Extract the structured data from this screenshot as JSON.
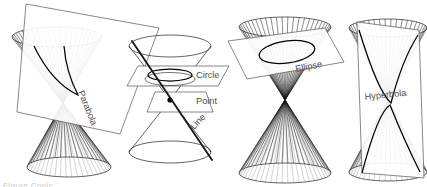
{
  "figure": {
    "background_color": "#ffffff",
    "line_color": "#4a4a4a",
    "curve_color": "#000000",
    "label_color": "#4d4d4d",
    "width": 427,
    "height": 187,
    "caption_text": "Figure  Conic"
  },
  "panels": [
    {
      "id": "parabola",
      "label": "Parabola",
      "description": "double cone cut by a plane parallel to a generator",
      "section_type": "parabola",
      "degenerate": false,
      "plane_orientation": "tilted-parallel-to-side",
      "label_rotation_deg": 68
    },
    {
      "id": "degenerate",
      "label": "",
      "description": "double cone cut by planes through the apex and horizontal",
      "section_type": "degenerate",
      "degenerate": true,
      "plane_orientation": "horizontal-and-through-apex",
      "sublabels": [
        {
          "id": "circle",
          "text": "Circle",
          "rotation_deg": 0
        },
        {
          "id": "point",
          "text": "Point",
          "rotation_deg": 0
        },
        {
          "id": "line",
          "text": "Line",
          "rotation_deg": -46
        }
      ]
    },
    {
      "id": "ellipse",
      "label": "Ellipse",
      "description": "double cone cut by an oblique plane through one nappe",
      "section_type": "ellipse",
      "degenerate": false,
      "plane_orientation": "oblique",
      "label_rotation_deg": -11
    },
    {
      "id": "hyperbola",
      "label": "Hyperbola",
      "description": "double cone cut by a vertical plane meeting both nappes",
      "section_type": "hyperbola",
      "degenerate": false,
      "plane_orientation": "vertical",
      "label_rotation_deg": -6
    }
  ]
}
